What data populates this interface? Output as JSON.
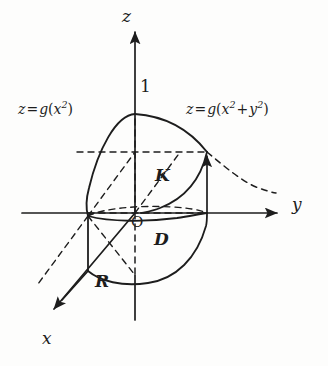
{
  "figure": {
    "background_color": "#fdfdfc",
    "stroke_color": "#1d1d1d"
  },
  "axes": [
    {
      "id": "z",
      "label": "z",
      "orientation": "vertical-up"
    },
    {
      "id": "y",
      "label": "y",
      "orientation": "horizontal-right"
    },
    {
      "id": "x",
      "label": "x",
      "orientation": "oblique-down-left"
    }
  ],
  "ticks": [
    {
      "axis": "z",
      "value": "1",
      "label": "1"
    }
  ],
  "points": [
    {
      "name": "origin",
      "label": "O"
    }
  ],
  "regions": [
    {
      "name": "K",
      "label": "K"
    },
    {
      "name": "D",
      "label": "D"
    },
    {
      "name": "R",
      "label": "R"
    }
  ],
  "curve_labels": {
    "left": {
      "lhs": "z",
      "equals": "=",
      "fn": "g",
      "open": "(",
      "arg_base": "x",
      "arg_exp": "2",
      "close": ")",
      "plain": "z = g(x²)"
    },
    "right": {
      "lhs": "z",
      "equals": "=",
      "fn": "g",
      "open": "(",
      "arg1_base": "x",
      "arg1_exp": "2",
      "plus": "+",
      "arg2_base": "y",
      "arg2_exp": "2",
      "close": ")",
      "plain": "z = g(x²+y²)"
    }
  }
}
